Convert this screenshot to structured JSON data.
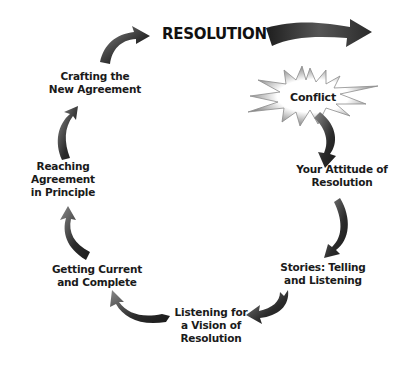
{
  "diagram": {
    "title": "RESOLUTION",
    "start_node": "Conflict",
    "steps": [
      {
        "lines": [
          "Your Attitude of",
          "Resolution"
        ]
      },
      {
        "lines": [
          "Stories: Telling",
          "and Listening"
        ]
      },
      {
        "lines": [
          "Listening for",
          "a Vision of",
          "Resolution"
        ]
      },
      {
        "lines": [
          "Getting Current",
          "and Complete"
        ]
      },
      {
        "lines": [
          "Reaching",
          "Agreement",
          "in Principle"
        ]
      },
      {
        "lines": [
          "Crafting the",
          "New Agreement"
        ]
      }
    ],
    "flow": "Conflict → Your Attitude of Resolution → Stories: Telling and Listening → Listening for a Vision of Resolution → Getting Current and Complete → Reaching Agreement in Principle → Crafting the New Agreement → RESOLUTION",
    "colors": {
      "arrow_dark": "#2b2b2b",
      "arrow_light": "#8a8a8a",
      "burst": "#9a9a9a",
      "text": "#1a1a1a"
    }
  }
}
